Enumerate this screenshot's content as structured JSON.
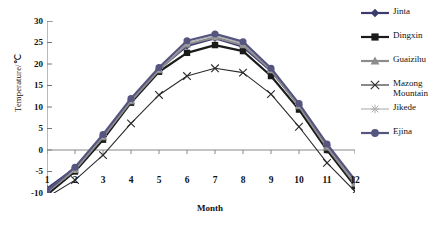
{
  "chart_data": {
    "type": "line",
    "title": "",
    "xlabel": "Month",
    "ylabel": "Temperature/℃",
    "x": [
      1,
      2,
      3,
      4,
      5,
      6,
      7,
      8,
      9,
      10,
      11,
      12
    ],
    "categories": [
      "1",
      "2",
      "3",
      "4",
      "5",
      "6",
      "7",
      "8",
      "9",
      "10",
      "11",
      "12"
    ],
    "xlim": [
      1,
      12
    ],
    "ylim": [
      -10,
      30
    ],
    "yticks": [
      -10,
      -5,
      0,
      5,
      10,
      15,
      20,
      25,
      30
    ],
    "ytick_labels": [
      "-10",
      "-5",
      "0",
      "5",
      "10",
      "15",
      "20",
      "25",
      "30"
    ],
    "grid": false,
    "legend_position": "right",
    "series": [
      {
        "name": "Jinta",
        "color": "#3b3b6e",
        "marker": "diamond",
        "values": [
          -9.0,
          -4.2,
          3.2,
          11.6,
          18.8,
          24.2,
          26.0,
          24.0,
          18.4,
          10.4,
          1.0,
          -7.2
        ]
      },
      {
        "name": "Dingxin",
        "color": "#1b1b1b",
        "marker": "square",
        "values": [
          -10.4,
          -5.0,
          2.4,
          11.0,
          18.2,
          22.6,
          24.4,
          23.0,
          17.2,
          9.4,
          0.0,
          -8.4
        ]
      },
      {
        "name": "Guaizihu",
        "color": "#8c8c8c",
        "marker": "triangle",
        "values": [
          -9.8,
          -4.6,
          3.0,
          11.4,
          18.6,
          24.6,
          26.2,
          24.4,
          18.6,
          10.2,
          0.6,
          -7.8
        ]
      },
      {
        "name": "Mazong\nMountain",
        "color": "#2b2b2b",
        "marker": "x",
        "values": [
          -11.0,
          -7.0,
          -1.2,
          6.2,
          12.8,
          17.2,
          19.0,
          18.0,
          13.0,
          5.4,
          -3.0,
          -9.6
        ]
      },
      {
        "name": "Jikede",
        "color": "#b0b0b0",
        "marker": "star",
        "values": [
          -9.4,
          -4.4,
          3.4,
          11.8,
          19.0,
          25.0,
          26.6,
          24.8,
          18.8,
          10.6,
          1.2,
          -7.4
        ]
      },
      {
        "name": "Ejina",
        "color": "#555580",
        "marker": "circle",
        "values": [
          -9.6,
          -4.0,
          3.6,
          12.0,
          19.2,
          25.4,
          27.0,
          25.2,
          19.0,
          10.8,
          1.4,
          -7.0
        ]
      }
    ]
  },
  "legend": {
    "items": [
      {
        "label": "Jinta"
      },
      {
        "label": "Dingxin"
      },
      {
        "label": "Guaizihu"
      },
      {
        "label": "Mazong\nMountain"
      },
      {
        "label": "Jikede"
      },
      {
        "label": "Ejina"
      }
    ]
  },
  "axes": {
    "x_title": "Month",
    "y_title": "Temperature/℃"
  }
}
